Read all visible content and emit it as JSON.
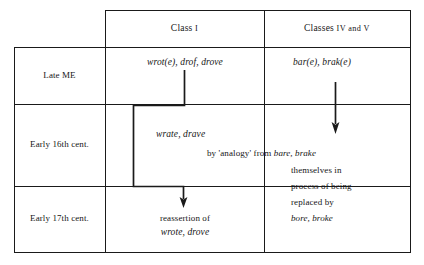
{
  "figure": {
    "type": "flow-table-diagram",
    "ink_color": "#1a1a1a",
    "background_color": "#ffffff"
  },
  "table": {
    "column_headers": [
      {
        "text": "Class",
        "numeral": "I"
      },
      {
        "text": "Classes",
        "numeral": "IV and V"
      }
    ],
    "row_headers": [
      "Late ME",
      "Early 16th cent.",
      "Early 17th cent."
    ]
  },
  "cells": {
    "late_me_class1": "wrot(e), drof, drove",
    "late_me_class45": "bar(e), brak(e)",
    "c16_class1": "wrate, drave",
    "c17_class1_line1": "reassertion of",
    "c17_class1_line2": "wrote, drove"
  },
  "annotation_right": {
    "line1_plain": "by 'analogy' from ",
    "line1_italic": "bare, brake",
    "line2": "themselves  in",
    "line3": "process of being",
    "line4": "replaced by",
    "line5_italic": "bore, broke"
  },
  "arrows": [
    {
      "name": "class1-analogy-arrow",
      "from": "wrot(e), drof, drove",
      "to": "reassertion of wrote, drove",
      "shape": "elbow-down-left-down-right-down"
    },
    {
      "name": "class45-replacement-arrow",
      "from": "bar(e), brak(e)",
      "to": "bare, brake",
      "shape": "straight-down"
    }
  ]
}
